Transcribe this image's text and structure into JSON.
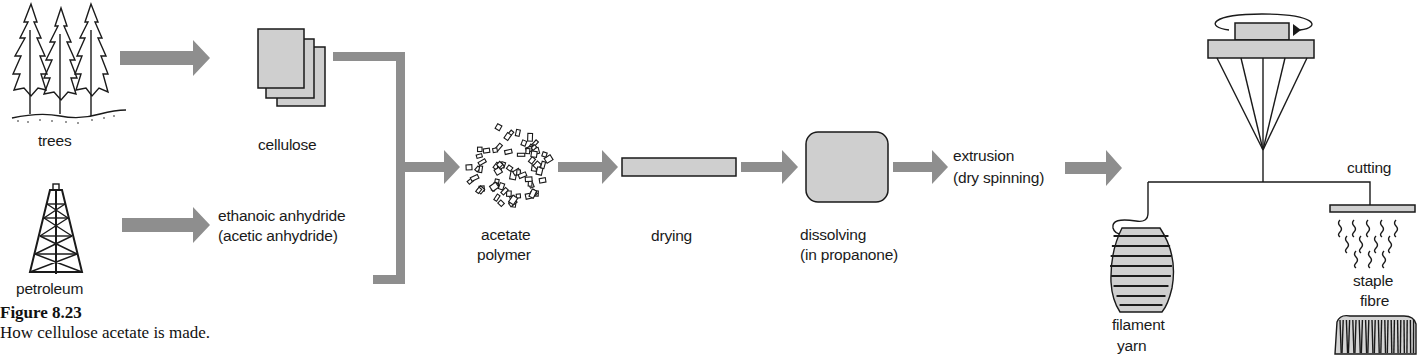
{
  "diagram": {
    "nodes": {
      "trees": {
        "label": "trees",
        "icon": "trees-icon"
      },
      "petroleum": {
        "label": "petroleum",
        "icon": "oil-derrick-icon"
      },
      "cellulose": {
        "label": "cellulose",
        "icon": "cellulose-sheets-icon"
      },
      "anhydride": {
        "line1": "ethanoic anhydride",
        "line2": "(acetic anhydride)"
      },
      "acetate_polymer": {
        "line1": "acetate",
        "line2": "polymer",
        "icon": "flakes-icon"
      },
      "drying": {
        "label": "drying",
        "icon": "drying-bar-icon"
      },
      "dissolving": {
        "line1": "dissolving",
        "line2": "(in propanone)",
        "icon": "dissolving-block-icon"
      },
      "extrusion": {
        "line1": "extrusion",
        "line2": "(dry spinning)"
      },
      "spinneret": {
        "icon": "spinneret-icon"
      },
      "cutting": {
        "label": "cutting",
        "icon": "cutter-icon"
      },
      "filament_yarn": {
        "line1": "filament",
        "line2": "yarn",
        "icon": "yarn-bobbin-icon"
      },
      "staple_fibre": {
        "line1": "staple",
        "line2": "fibre",
        "icon": "fibre-bale-icon"
      }
    },
    "flow": [
      [
        "trees",
        "cellulose"
      ],
      [
        "petroleum",
        "anhydride"
      ],
      [
        "cellulose",
        "acetate_polymer"
      ],
      [
        "anhydride",
        "acetate_polymer"
      ],
      [
        "acetate_polymer",
        "drying"
      ],
      [
        "drying",
        "dissolving"
      ],
      [
        "dissolving",
        "extrusion"
      ],
      [
        "extrusion",
        "spinneret"
      ],
      [
        "spinneret",
        "filament_yarn"
      ],
      [
        "spinneret",
        "cutting"
      ],
      [
        "cutting",
        "staple_fibre"
      ]
    ],
    "colors": {
      "arrow": "#8e8e8e",
      "fill": "#cfcfcf",
      "ink": "#1a1a1a"
    }
  },
  "figure": {
    "title": "Figure 8.23",
    "caption": "How cellulose acetate is made."
  }
}
